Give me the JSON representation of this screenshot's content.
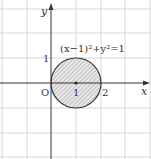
{
  "diagram": {
    "axes": {
      "x_label": "x",
      "y_label": "y",
      "origin_label": "O"
    },
    "ticks": {
      "x": [
        "1",
        "2"
      ],
      "y": [
        "1"
      ]
    },
    "equation": "(x−1)²+y²=1",
    "circle": {
      "center": [
        1,
        0
      ],
      "radius": 1,
      "fill": "hatched gray",
      "center_label": "1"
    },
    "colors": {
      "grid": "#d4d4d4",
      "axis": "#333333",
      "circle_stroke": "#333333",
      "hatch": "#999999",
      "fill": "#e6e6e6"
    }
  }
}
